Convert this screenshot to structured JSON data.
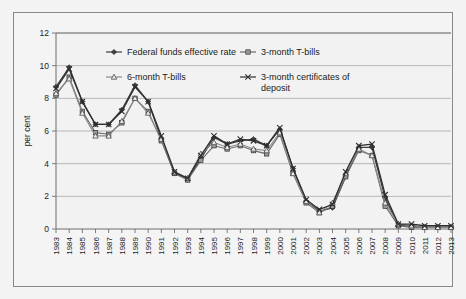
{
  "chart_data": {
    "type": "line",
    "title": "",
    "xlabel": "",
    "ylabel": "per cent",
    "ylim": [
      0,
      12
    ],
    "yticks": [
      0,
      2,
      4,
      6,
      8,
      10,
      12
    ],
    "grid": "horizontal",
    "legend_position": "inside-top",
    "categories": [
      "1983",
      "1984",
      "1985",
      "1986",
      "1987",
      "1988",
      "1989",
      "1990",
      "1991",
      "1992",
      "1993",
      "1994",
      "1995",
      "1996",
      "1997",
      "1998",
      "1999",
      "2000",
      "2001",
      "2002",
      "2003",
      "2004",
      "2005",
      "2006",
      "2007",
      "2008",
      "2009",
      "2010",
      "2011",
      "2012",
      "2013"
    ],
    "series": [
      {
        "name": "Federal funds effective rate",
        "marker": "diamond",
        "color": "#3f3f3f",
        "values": [
          8.7,
          9.9,
          7.8,
          6.4,
          6.4,
          7.3,
          8.8,
          7.8,
          5.5,
          3.4,
          3.1,
          4.3,
          5.6,
          5.2,
          5.4,
          5.5,
          5.1,
          6.1,
          3.7,
          1.7,
          1.1,
          1.3,
          3.2,
          5.0,
          5.0,
          1.9,
          0.2,
          0.2,
          0.1,
          0.1,
          0.1
        ]
      },
      {
        "name": "3-month T-bills",
        "marker": "square",
        "color": "#6b6b6b",
        "values": [
          8.2,
          9.3,
          7.2,
          5.9,
          5.8,
          6.5,
          8.0,
          7.2,
          5.4,
          3.4,
          3.0,
          4.2,
          5.1,
          4.9,
          5.1,
          4.8,
          4.6,
          5.8,
          3.4,
          1.6,
          1.0,
          1.4,
          3.2,
          4.8,
          4.5,
          1.4,
          0.2,
          0.1,
          0.1,
          0.1,
          0.1
        ]
      },
      {
        "name": "6-month T-bills",
        "marker": "triangle",
        "color": "#8a8a8a",
        "values": [
          8.3,
          9.2,
          7.1,
          5.7,
          5.7,
          6.6,
          8.0,
          7.1,
          5.5,
          3.5,
          3.1,
          4.6,
          5.3,
          5.0,
          5.2,
          4.9,
          4.8,
          5.9,
          3.4,
          1.7,
          1.0,
          1.6,
          3.4,
          4.9,
          4.5,
          1.6,
          0.3,
          0.2,
          0.1,
          0.1,
          0.1
        ]
      },
      {
        "name": "3-month certificates of deposit",
        "marker": "cross",
        "color": "#2e2e2e",
        "values": [
          8.6,
          9.8,
          7.8,
          6.4,
          6.4,
          7.2,
          8.7,
          7.8,
          5.7,
          3.5,
          3.1,
          4.5,
          5.7,
          5.2,
          5.5,
          5.4,
          5.1,
          6.2,
          3.7,
          1.8,
          1.2,
          1.5,
          3.5,
          5.1,
          5.2,
          2.1,
          0.3,
          0.3,
          0.2,
          0.2,
          0.2
        ]
      }
    ]
  },
  "axes": {
    "y_title": "per cent",
    "y_tick_labels": [
      "0",
      "2",
      "4",
      "6",
      "8",
      "10",
      "12"
    ],
    "x_tick_labels": [
      "1983",
      "1984",
      "1985",
      "1986",
      "1987",
      "1988",
      "1989",
      "1990",
      "1991",
      "1992",
      "1993",
      "1994",
      "1995",
      "1996",
      "1997",
      "1998",
      "1999",
      "2000",
      "2001",
      "2002",
      "2003",
      "2004",
      "2005",
      "2006",
      "2007",
      "2008",
      "2009",
      "2010",
      "2011",
      "2012",
      "2013"
    ]
  },
  "legend": {
    "entries": [
      {
        "label": "Federal funds effective rate",
        "marker": "diamond"
      },
      {
        "label": "3-month T-bills",
        "marker": "square"
      },
      {
        "label": "6-month T-bills",
        "marker": "triangle"
      },
      {
        "label": "3-month certificates of",
        "label2": "deposit",
        "marker": "cross"
      }
    ]
  }
}
